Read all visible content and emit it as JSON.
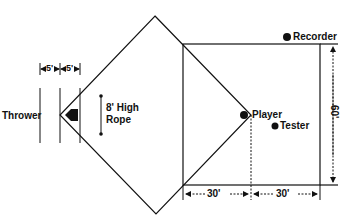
{
  "diagram": {
    "labels": {
      "thrower": "Thrower",
      "rope_line1": "8' High",
      "rope_line2": "Rope",
      "player": "Player",
      "tester": "Tester",
      "recorder": "Recorder",
      "dim_5a": "5'",
      "dim_5b": "5'",
      "dim_30a": "30'",
      "dim_30b": "30'",
      "dim_60": "60'"
    },
    "colors": {
      "line": "#111111",
      "background": "#ffffff"
    }
  }
}
